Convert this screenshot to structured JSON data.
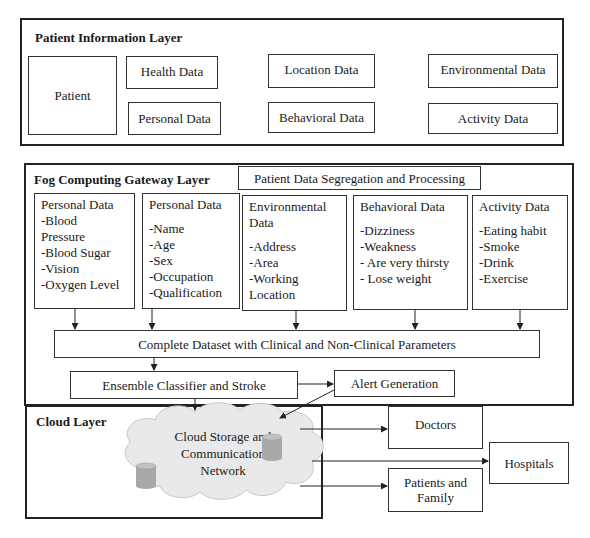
{
  "patient_layer": {
    "title": "Patient Information Layer",
    "patient": "Patient",
    "boxes": [
      "Health Data",
      "Personal Data",
      "Location Data",
      "Behavioral Data",
      "Environmental Data",
      "Activity Data"
    ]
  },
  "fog_layer": {
    "title": "Fog Computing Gateway Layer",
    "segregation": "Patient Data Segregation and Processing",
    "columns": [
      {
        "title": "Personal Data",
        "items": [
          "-Blood",
          "Pressure",
          "-Blood Sugar",
          "-Vision",
          "-Oxygen Level"
        ]
      },
      {
        "title": "Personal Data",
        "items": [
          "-Name",
          "-Age",
          "-Sex",
          "-Occupation",
          "-Qualification"
        ]
      },
      {
        "title": "Environmental Data",
        "items": [
          "-Address",
          "-Area",
          "-Working",
          "Location"
        ]
      },
      {
        "title": "Behavioral Data",
        "items": [
          "-Dizziness",
          "-Weakness",
          "- Are very thirsty",
          "- Lose weight"
        ]
      },
      {
        "title": "Activity Data",
        "items": [
          "-Eating habit",
          "-Smoke",
          "-Drink",
          "-Exercise"
        ]
      }
    ],
    "dataset": "Complete Dataset with Clinical and Non-Clinical Parameters",
    "classifier": "Ensemble Classifier and Stroke",
    "alert": "Alert Generation"
  },
  "cloud_layer": {
    "title": "Cloud Layer",
    "cloud_label": [
      "Cloud Storage and",
      "Communication",
      "Network"
    ]
  },
  "outputs": {
    "doctors": "Doctors",
    "hospitals": "Hospitals",
    "patients_family": [
      "Patients and",
      "Family"
    ]
  },
  "colors": {
    "border": "#222222",
    "cloud_fill": "#e8e8e8",
    "db_fill": "#a9a9a9"
  }
}
